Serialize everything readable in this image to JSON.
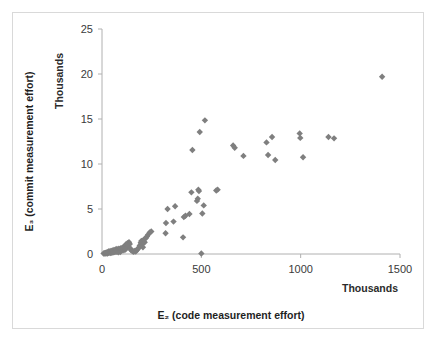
{
  "chart_data": {
    "type": "scatter",
    "title": "",
    "xlabel": "E₂ (code measurement effort)",
    "ylabel": "E₃ (commit measurement effort)",
    "x_unit_label": "Thousands",
    "y_unit_label": "Thousands",
    "xlim": [
      0,
      1500
    ],
    "ylim": [
      0,
      25
    ],
    "xticks": [
      0,
      500,
      1000,
      1500
    ],
    "yticks": [
      0,
      5,
      10,
      15,
      20,
      25
    ],
    "xtick_labels": [
      "0",
      "500",
      "1000",
      "1500"
    ],
    "ytick_labels": [
      "0",
      "5",
      "10",
      "15",
      "20",
      "25"
    ],
    "grid": false,
    "legend": false,
    "marker": "diamond",
    "marker_color": "#7f7f7f",
    "series": [
      {
        "name": "projects",
        "points": [
          [
            8,
            0.05
          ],
          [
            12,
            0.08
          ],
          [
            15,
            0.05
          ],
          [
            18,
            0.12
          ],
          [
            20,
            0.05
          ],
          [
            22,
            0.18
          ],
          [
            25,
            0.1
          ],
          [
            28,
            0.05
          ],
          [
            30,
            0.22
          ],
          [
            32,
            0.12
          ],
          [
            35,
            0.3
          ],
          [
            38,
            0.15
          ],
          [
            40,
            0.25
          ],
          [
            42,
            0.1
          ],
          [
            45,
            0.35
          ],
          [
            48,
            0.2
          ],
          [
            50,
            0.12
          ],
          [
            52,
            0.4
          ],
          [
            55,
            0.28
          ],
          [
            58,
            0.18
          ],
          [
            60,
            0.45
          ],
          [
            62,
            0.3
          ],
          [
            65,
            0.22
          ],
          [
            68,
            0.5
          ],
          [
            70,
            0.35
          ],
          [
            72,
            0.25
          ],
          [
            75,
            0.55
          ],
          [
            78,
            0.4
          ],
          [
            80,
            0.3
          ],
          [
            82,
            0.18
          ],
          [
            85,
            0.6
          ],
          [
            88,
            0.45
          ],
          [
            90,
            0.32
          ],
          [
            92,
            0.22
          ],
          [
            95,
            0.65
          ],
          [
            98,
            0.5
          ],
          [
            100,
            0.38
          ],
          [
            103,
            0.7
          ],
          [
            106,
            0.55
          ],
          [
            110,
            0.42
          ],
          [
            112,
            0.85
          ],
          [
            115,
            0.68
          ],
          [
            118,
            0.5
          ],
          [
            120,
            1.05
          ],
          [
            122,
            0.9
          ],
          [
            125,
            0.75
          ],
          [
            128,
            1.2
          ],
          [
            130,
            1.0
          ],
          [
            133,
            0.82
          ],
          [
            136,
            1.3
          ],
          [
            140,
            1.1
          ],
          [
            143,
            0.6
          ],
          [
            146,
            0.45
          ],
          [
            150,
            0.38
          ],
          [
            155,
            0.3
          ],
          [
            160,
            0.25
          ],
          [
            165,
            0.35
          ],
          [
            170,
            0.28
          ],
          [
            175,
            0.45
          ],
          [
            180,
            0.55
          ],
          [
            185,
            0.7
          ],
          [
            190,
            0.95
          ],
          [
            195,
            1.25
          ],
          [
            198,
            1.45
          ],
          [
            202,
            1.05
          ],
          [
            206,
            0.75
          ],
          [
            210,
            1.6
          ],
          [
            215,
            1.3
          ],
          [
            220,
            1.75
          ],
          [
            226,
            1.95
          ],
          [
            232,
            2.15
          ],
          [
            240,
            2.4
          ],
          [
            248,
            2.5
          ],
          [
            320,
            2.3
          ],
          [
            322,
            3.45
          ],
          [
            330,
            5.0
          ],
          [
            360,
            3.6
          ],
          [
            368,
            5.3
          ],
          [
            408,
            1.85
          ],
          [
            412,
            4.1
          ],
          [
            420,
            4.25
          ],
          [
            440,
            4.45
          ],
          [
            450,
            6.85
          ],
          [
            455,
            11.55
          ],
          [
            478,
            5.9
          ],
          [
            482,
            6.15
          ],
          [
            485,
            7.15
          ],
          [
            488,
            7.0
          ],
          [
            492,
            13.55
          ],
          [
            500,
            0.05
          ],
          [
            505,
            4.5
          ],
          [
            512,
            5.4
          ],
          [
            518,
            14.85
          ],
          [
            575,
            7.05
          ],
          [
            582,
            7.15
          ],
          [
            660,
            12.05
          ],
          [
            668,
            11.8
          ],
          [
            712,
            10.9
          ],
          [
            828,
            12.4
          ],
          [
            836,
            11.0
          ],
          [
            856,
            13.0
          ],
          [
            872,
            10.45
          ],
          [
            995,
            13.4
          ],
          [
            998,
            12.9
          ],
          [
            1012,
            10.75
          ],
          [
            1140,
            13.0
          ],
          [
            1168,
            12.85
          ],
          [
            1410,
            19.7
          ]
        ]
      }
    ]
  }
}
